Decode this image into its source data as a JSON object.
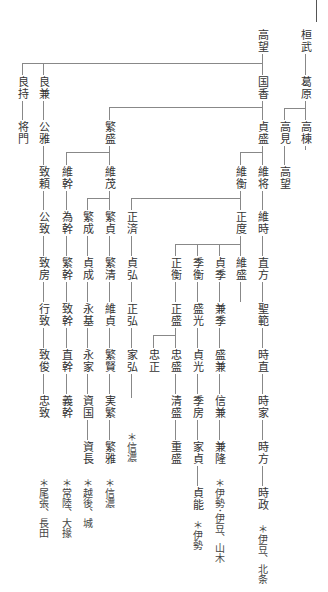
{
  "chart": {
    "top_mark": "|",
    "nodes": {
      "kanmu": "桓武",
      "kazurahara": "葛原",
      "takamune": "高棟",
      "takami": "高見",
      "takamochi": "高望",
      "takamochi2": "高望",
      "kunika": "国香",
      "sadamori": "貞盛",
      "koremasa": "維将",
      "koretoki": "維時",
      "naokata": "直方",
      "shohan": "聖範",
      "tokinao": "時直",
      "tokiie": "時家",
      "tokikata": "時方",
      "tokimasa": "時政",
      "korehira": "維衡",
      "masanori": "正度",
      "koremori": "維盛",
      "sadasue": "貞季",
      "kanesue": "兼季",
      "morikane": "盛兼",
      "nobukane": "信兼",
      "kanetaka": "兼隆",
      "suehira": "季衡",
      "morimitsu": "盛光",
      "sadamitsu": "貞光",
      "suefusa": "季房",
      "iesada": "家貞",
      "sadayoshi": "貞能",
      "masahira": "正衡",
      "masamori": "正盛",
      "tadamori": "忠盛",
      "kiyomori": "清盛",
      "shigemori": "重盛",
      "tadamasa": "忠正",
      "masazumi": "正済",
      "sadahiro": "貞弘",
      "masahiro": "正弘",
      "iehiro": "家弘",
      "shigemori_b": "繁盛",
      "koreshige": "維茂",
      "shigesada": "繁貞",
      "shigekiyo": "繁清",
      "koresada": "維貞",
      "shigekata": "繁賢",
      "sanehige": "実繁",
      "shigemasa": "繁雅",
      "shigenari": "繁成",
      "sadanari": "貞成",
      "nagamoto": "永基",
      "nagaie": "永家",
      "sukekuni": "資国",
      "sukenaga": "資長",
      "koremoto": "維幹",
      "tamemoto": "為幹",
      "shigemoto": "繁幹",
      "munemoto": "致幹",
      "naomoto": "直幹",
      "yoshimoto": "義幹",
      "yoshikane": "良兼",
      "kinmasa": "公雅",
      "muneyori": "致頼",
      "kinmune": "公致",
      "munefusa": "致房",
      "yukimune": "行致",
      "munetoshi": "致俊",
      "tadamune": "忠致",
      "yoshimochi": "良持",
      "masakado": "将門"
    },
    "notes": {
      "hojo": "＊伊豆、北条",
      "yamaki": "＊伊勢･伊豆、山木",
      "ise": "＊伊勢",
      "shinano1": "＊信濃",
      "shinano2": "＊信濃",
      "echigo": "＊越後、城",
      "hitachi": "＊常陸、大掾",
      "owari": "＊尾張、長田"
    }
  }
}
